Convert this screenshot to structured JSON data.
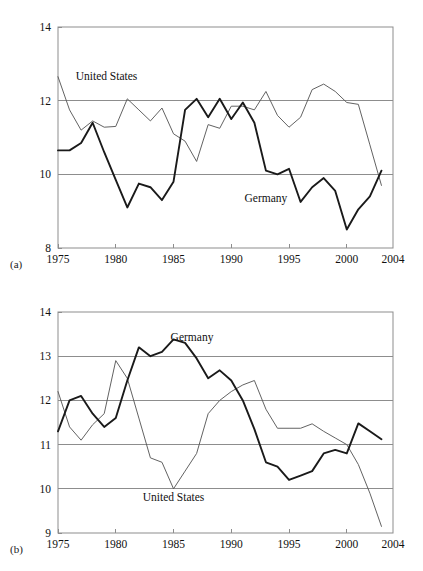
{
  "figure": {
    "panels": [
      {
        "key": "a",
        "panel_label": "(a)",
        "series_labels": {
          "us": "United States",
          "germany": "Germany"
        }
      },
      {
        "key": "b",
        "panel_label": "(b)",
        "series_labels": {
          "us": "United States",
          "germany": "Germany"
        }
      }
    ]
  },
  "chart_data": [
    {
      "type": "line",
      "panel": "(a)",
      "title": "",
      "xlabel": "",
      "ylabel": "",
      "xlim": [
        1975,
        2004
      ],
      "ylim": [
        8,
        14
      ],
      "grid": "horizontal",
      "legend": "inline-annotation",
      "xticks": [
        1975,
        1980,
        1985,
        1990,
        1995,
        2000,
        2004
      ],
      "xtick_labels": [
        "1975",
        "1980",
        "1985",
        "1990",
        "1995",
        "2000",
        "2004"
      ],
      "yticks": [
        8,
        10,
        12,
        14
      ],
      "ytick_labels": [
        "8",
        "10",
        "12",
        "14"
      ],
      "annotations": [
        {
          "text": "United States",
          "x": 1979.2,
          "y": 12.55
        },
        {
          "text": "Germany",
          "x": 1993.0,
          "y": 9.25
        }
      ],
      "series": [
        {
          "name": "United States",
          "x": [
            1975,
            1976,
            1977,
            1978,
            1979,
            1980,
            1981,
            1982,
            1983,
            1984,
            1985,
            1986,
            1987,
            1988,
            1989,
            1990,
            1991,
            1992,
            1993,
            1994,
            1995,
            1996,
            1997,
            1998,
            1999,
            2000,
            2001,
            2002,
            2003
          ],
          "values": [
            12.65,
            11.75,
            11.2,
            11.45,
            11.28,
            11.3,
            12.05,
            11.75,
            11.45,
            11.8,
            11.1,
            10.9,
            10.35,
            11.35,
            11.25,
            11.85,
            11.85,
            11.75,
            12.25,
            11.6,
            11.28,
            11.55,
            12.3,
            12.45,
            12.25,
            11.95,
            11.9,
            10.8,
            9.7
          ]
        },
        {
          "name": "Germany",
          "x": [
            1975,
            1976,
            1977,
            1978,
            1979,
            1980,
            1981,
            1982,
            1983,
            1984,
            1985,
            1986,
            1987,
            1988,
            1989,
            1990,
            1991,
            1992,
            1993,
            1994,
            1995,
            1996,
            1997,
            1998,
            1999,
            2000,
            2001,
            2002,
            2003
          ],
          "values": [
            10.65,
            10.65,
            10.85,
            11.4,
            10.6,
            9.85,
            9.1,
            9.75,
            9.65,
            9.3,
            9.8,
            11.75,
            12.05,
            11.55,
            12.05,
            11.5,
            11.95,
            11.4,
            10.1,
            10.0,
            10.15,
            9.25,
            9.65,
            9.9,
            9.55,
            8.5,
            9.05,
            9.4,
            10.1
          ]
        }
      ]
    },
    {
      "type": "line",
      "panel": "(b)",
      "title": "",
      "xlabel": "",
      "ylabel": "",
      "xlim": [
        1975,
        2004
      ],
      "ylim": [
        9,
        14
      ],
      "grid": "horizontal",
      "legend": "inline-annotation",
      "xticks": [
        1975,
        1980,
        1985,
        1990,
        1995,
        2000,
        2004
      ],
      "xtick_labels": [
        "1975",
        "1980",
        "1985",
        "1990",
        "1995",
        "2000",
        "2004"
      ],
      "yticks": [
        9,
        10,
        11,
        12,
        13,
        14
      ],
      "ytick_labels": [
        "9",
        "10",
        "11",
        "12",
        "13",
        "14"
      ],
      "annotations": [
        {
          "text": "Germany",
          "x": 1986.6,
          "y": 13.35
        },
        {
          "text": "United States",
          "x": 1985.0,
          "y": 9.72
        }
      ],
      "series": [
        {
          "name": "United States",
          "x": [
            1975,
            1976,
            1977,
            1978,
            1979,
            1980,
            1981,
            1982,
            1983,
            1984,
            1985,
            1986,
            1987,
            1988,
            1989,
            1990,
            1991,
            1992,
            1993,
            1994,
            1995,
            1996,
            1997,
            1998,
            1999,
            2000,
            2001,
            2002,
            2003
          ],
          "values": [
            12.2,
            11.4,
            11.1,
            11.45,
            11.7,
            12.9,
            12.5,
            11.6,
            10.7,
            10.6,
            10.0,
            10.4,
            10.8,
            11.7,
            12.0,
            12.2,
            12.35,
            12.45,
            11.8,
            11.37,
            11.37,
            11.37,
            11.47,
            11.3,
            11.15,
            11.0,
            10.55,
            9.9,
            9.15
          ]
        },
        {
          "name": "Germany",
          "x": [
            1975,
            1976,
            1977,
            1978,
            1979,
            1980,
            1981,
            1982,
            1983,
            1984,
            1985,
            1986,
            1987,
            1988,
            1989,
            1990,
            1991,
            1992,
            1993,
            1994,
            1995,
            1996,
            1997,
            1998,
            1999,
            2000,
            2001,
            2002,
            2003
          ],
          "values": [
            11.3,
            12.0,
            12.1,
            11.7,
            11.4,
            11.6,
            12.45,
            13.2,
            13.0,
            13.1,
            13.38,
            13.3,
            12.95,
            12.5,
            12.68,
            12.45,
            12.0,
            11.35,
            10.6,
            10.5,
            10.2,
            10.3,
            10.4,
            10.8,
            10.88,
            10.8,
            11.48,
            11.3,
            11.12
          ]
        }
      ]
    }
  ]
}
